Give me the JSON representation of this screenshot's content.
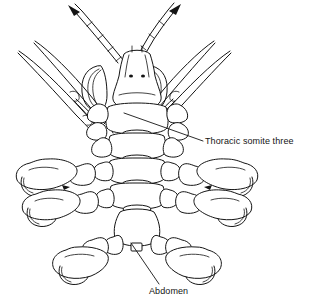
{
  "figure": {
    "type": "scientific-line-drawing",
    "background_color": "#ffffff",
    "ink_color": "#141414",
    "width": 317,
    "height": 307
  },
  "labels": [
    {
      "id": "thoracic-somite-three",
      "text": "Thoracic somite three",
      "x": 205,
      "y": 137,
      "leader_from": [
        203,
        141
      ],
      "leader_to": [
        124,
        113
      ]
    },
    {
      "id": "abdomen",
      "text": "Abdomen",
      "x": 149,
      "y": 287,
      "leader_from": [
        159,
        284
      ],
      "leader_to": [
        131,
        243
      ]
    }
  ],
  "anatomy": {
    "antennae_count": 2,
    "eye_dots": 2,
    "eye_stalks_count": 2,
    "thoracic_somites": 5,
    "spine_appendages_per_side": 3,
    "chelate_legs_per_side": 2,
    "terminal_legs_per_side": 1,
    "abdomen_segments": 1
  }
}
